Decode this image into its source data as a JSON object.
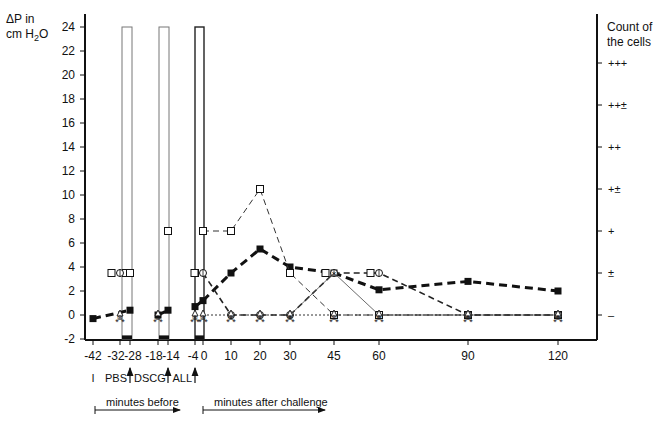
{
  "chart_data": {
    "type": "line",
    "ylabel_left": "ΔP in cm H2O",
    "ylabel_left_line1": "ΔP in",
    "ylabel_left_line2": "cm H",
    "ylabel_left_sub": "2",
    "ylabel_left_tail": "O",
    "ylabel_right_line1": "Count of",
    "ylabel_right_line2": "the cells",
    "ylim": [
      -2,
      24
    ],
    "y_ticks": [
      -2,
      0,
      2,
      4,
      6,
      8,
      10,
      12,
      14,
      16,
      18,
      20,
      22,
      24
    ],
    "x_ticks": [
      -42,
      -32,
      -28,
      -18,
      -14,
      -4,
      0,
      10,
      20,
      30,
      45,
      60,
      90,
      120
    ],
    "right_ticks": [
      {
        "value": 0,
        "label": "–"
      },
      {
        "value": 3.5,
        "label": "±"
      },
      {
        "value": 7,
        "label": "+"
      },
      {
        "value": 10.5,
        "label": "+±"
      },
      {
        "value": 14,
        "label": "++"
      },
      {
        "value": 17.5,
        "label": "++±"
      },
      {
        "value": 21,
        "label": "+++"
      }
    ],
    "grid": false,
    "annotations": {
      "markers": [
        {
          "label": "I",
          "x": -42
        },
        {
          "label": "PBS",
          "x": -28,
          "arrow": true
        },
        {
          "label": "DSCG",
          "x": -14,
          "arrow": true
        },
        {
          "label": "ALL",
          "x": -4,
          "arrow": true
        }
      ],
      "spans": [
        {
          "label": "minutes before"
        },
        {
          "label": "minutes after challenge"
        }
      ]
    },
    "bars": [
      {
        "x_from": -30,
        "x_to": -26,
        "top": 24,
        "bottom": -2,
        "label": "PBS inhalation"
      },
      {
        "x_from": -17,
        "x_to": -13,
        "top": 24,
        "bottom": -2,
        "label": "DSCG inhalation"
      },
      {
        "x_from": -4,
        "x_to": -0.5,
        "top": 24,
        "bottom": -2,
        "label": "Allergen challenge"
      }
    ],
    "series": [
      {
        "name": "ΔP (filled squares, thick dashed)",
        "marker": "filled-square",
        "x": [
          -42,
          -28,
          -18,
          -14,
          -4,
          0,
          10,
          20,
          30,
          45,
          60,
          90,
          120
        ],
        "values": [
          -0.3,
          0.4,
          0,
          0.4,
          0.7,
          1.2,
          3.5,
          5.5,
          4,
          3.5,
          2.1,
          2.8,
          2
        ]
      },
      {
        "name": "Cell count (open squares, dashed)",
        "marker": "open-square",
        "x": [
          -32,
          -28,
          -14,
          -4,
          0,
          10,
          20,
          30,
          45,
          60,
          90,
          120
        ],
        "values": [
          3.5,
          3.5,
          7,
          3.5,
          7,
          7,
          10.5,
          3.5,
          0,
          0,
          0,
          0
        ]
      },
      {
        "name": "Cell count (circles, dashed)",
        "marker": "open-circle",
        "x": [
          -32,
          0,
          10,
          20,
          30,
          45,
          60,
          90,
          120
        ],
        "values": [
          3.5,
          3.5,
          0,
          0,
          0,
          3.5,
          3.5,
          0,
          0
        ]
      },
      {
        "name": "Cell count (x, thin solid)",
        "marker": "x",
        "x": [
          30,
          45,
          60,
          90,
          120
        ],
        "values": [
          0,
          3.5,
          0,
          0,
          0
        ]
      },
      {
        "name": "Baseline cells (triangles / stars, dotted)",
        "marker": "triangle",
        "x": [
          -32,
          -18,
          -4,
          0,
          10,
          20,
          30,
          45,
          60,
          90,
          120
        ],
        "values": [
          0,
          0,
          0,
          0,
          0,
          0,
          0,
          0,
          0,
          0,
          0
        ]
      }
    ]
  }
}
